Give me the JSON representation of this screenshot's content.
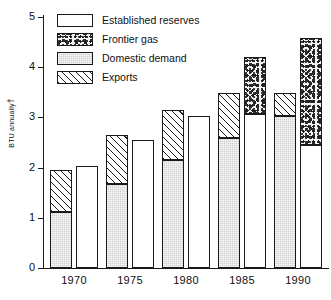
{
  "chart_data": {
    "type": "bar",
    "title": "",
    "xlabel": "",
    "ylabel": "BTU annually",
    "ylabel_suffix": "†",
    "ylim": [
      0,
      5
    ],
    "yticks": [
      "0",
      "1",
      "2",
      "3",
      "4",
      "5"
    ],
    "grid": false,
    "legend_position": "top-left",
    "categories": [
      "1970",
      "1975",
      "1980",
      "1985",
      "1990"
    ],
    "note": "Each year has a left bar (supply/use: Domestic demand + Exports) and a right bar (resources: Established reserves + Frontier gas).",
    "series": [
      {
        "name": "Domestic demand",
        "pattern": "gray",
        "bar": "left",
        "values": [
          1.12,
          1.68,
          2.15,
          2.58,
          3.02
        ]
      },
      {
        "name": "Exports",
        "pattern": "hatch",
        "bar": "left",
        "values": [
          0.83,
          0.97,
          1.0,
          0.9,
          0.46
        ]
      },
      {
        "name": "Established reserves",
        "pattern": "white",
        "bar": "right",
        "values": [
          2.03,
          2.55,
          3.03,
          3.06,
          2.46
        ]
      },
      {
        "name": "Frontier gas",
        "pattern": "speck",
        "bar": "right",
        "values": [
          0.0,
          0.0,
          0.0,
          1.15,
          2.12
        ]
      }
    ],
    "bar_totals": {
      "left": [
        1.95,
        2.65,
        3.15,
        3.48,
        3.48
      ],
      "right": [
        2.03,
        2.55,
        3.03,
        4.21,
        4.58
      ]
    }
  },
  "legend": {
    "items": [
      {
        "label": "Established reserves",
        "pattern": "white"
      },
      {
        "label": "Frontier gas",
        "pattern": "speck"
      },
      {
        "label": "Domestic demand",
        "pattern": "gray"
      },
      {
        "label": "Exports",
        "pattern": "hatch"
      }
    ]
  },
  "colors": {
    "axis": "#1a1a1a",
    "text": "#111111",
    "gray_fill": "#cfcfcf",
    "white_fill": "#ffffff",
    "speckle_fill": "#f2f2f2",
    "background": "#ffffff"
  }
}
